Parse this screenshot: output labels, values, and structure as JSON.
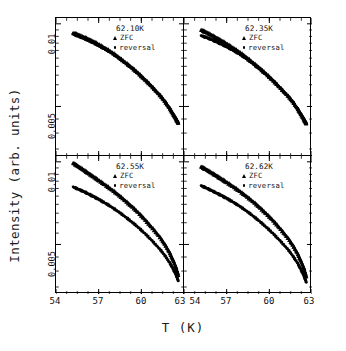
{
  "figure": {
    "xlabel": "T (K)",
    "ylabel": "Intensity (arb. units)"
  },
  "chart_data": {
    "type": "line",
    "title": "",
    "xlabel": "T (K)",
    "ylabel": "Intensity (arb. units)",
    "xlim": [
      54,
      63
    ],
    "ylim": [
      0.0033,
      0.0105
    ],
    "yscale": "log",
    "grid": false,
    "legend_position": "inside-top-right",
    "xticks": [
      54,
      57,
      60,
      63
    ],
    "xtick_labels": [
      "54",
      "57",
      "60",
      "63"
    ],
    "yticks": [
      0.005,
      0.01
    ],
    "ytick_labels": [
      "0.005",
      "0.01"
    ],
    "panels": [
      {
        "id": "panel-62-10",
        "annotation": "62.10K",
        "row": 0,
        "col": 0,
        "series": [
          {
            "name": "ZFC",
            "marker": "triangle",
            "x": [
              55.2,
              55.5,
              55.8,
              56.1,
              56.4,
              56.7,
              57.0,
              57.4,
              57.8,
              58.2,
              58.6,
              59.0,
              59.4,
              59.8,
              60.2,
              60.6,
              61.0,
              61.4,
              61.7,
              62.0,
              62.2,
              62.4,
              62.5,
              62.6
            ],
            "y": [
              0.00925,
              0.00915,
              0.009,
              0.00888,
              0.00872,
              0.00858,
              0.0084,
              0.00818,
              0.00795,
              0.0077,
              0.00742,
              0.00715,
              0.00688,
              0.0066,
              0.0063,
              0.00602,
              0.00572,
              0.00543,
              0.00518,
              0.00492,
              0.00472,
              0.00455,
              0.00444,
              0.00436
            ]
          },
          {
            "name": "reversal",
            "marker": "dot",
            "x": [
              55.2,
              55.5,
              55.8,
              56.1,
              56.4,
              56.7,
              57.0,
              57.4,
              57.8,
              58.2,
              58.6,
              59.0,
              59.4,
              59.8,
              60.2,
              60.6,
              61.0,
              61.4,
              61.7,
              62.0,
              62.2,
              62.4,
              62.5,
              62.6
            ],
            "y": [
              0.00918,
              0.00905,
              0.00892,
              0.00878,
              0.00864,
              0.0085,
              0.00834,
              0.00812,
              0.0079,
              0.00765,
              0.00738,
              0.00712,
              0.00685,
              0.00657,
              0.00628,
              0.006,
              0.0057,
              0.00542,
              0.00517,
              0.00491,
              0.00471,
              0.00454,
              0.00443,
              0.00435
            ]
          }
        ]
      },
      {
        "id": "panel-62-35",
        "annotation": "62.35K",
        "row": 0,
        "col": 1,
        "series": [
          {
            "name": "ZFC",
            "marker": "triangle",
            "x": [
              55.2,
              55.5,
              55.8,
              56.1,
              56.4,
              56.7,
              57.0,
              57.4,
              57.8,
              58.2,
              58.6,
              59.0,
              59.4,
              59.8,
              60.2,
              60.6,
              61.0,
              61.4,
              61.7,
              62.0,
              62.2,
              62.4,
              62.5,
              62.6
            ],
            "y": [
              0.0095,
              0.00935,
              0.00918,
              0.009,
              0.00882,
              0.00864,
              0.00845,
              0.0082,
              0.00795,
              0.00768,
              0.0074,
              0.00712,
              0.00684,
              0.00655,
              0.00626,
              0.00597,
              0.00568,
              0.0054,
              0.00516,
              0.0049,
              0.0047,
              0.00453,
              0.00442,
              0.00434
            ]
          },
          {
            "name": "reversal",
            "marker": "dot",
            "x": [
              55.2,
              55.5,
              55.8,
              56.1,
              56.4,
              56.7,
              57.0,
              57.4,
              57.8,
              58.2,
              58.6,
              59.0,
              59.4,
              59.8,
              60.2,
              60.6,
              61.0,
              61.4,
              61.7,
              62.0,
              62.2,
              62.4,
              62.5,
              62.6
            ],
            "y": [
              0.00905,
              0.00895,
              0.00882,
              0.00868,
              0.00854,
              0.0084,
              0.00825,
              0.00803,
              0.00781,
              0.00757,
              0.00732,
              0.00706,
              0.0068,
              0.00653,
              0.00625,
              0.00596,
              0.00567,
              0.00539,
              0.00515,
              0.00489,
              0.00469,
              0.00452,
              0.00441,
              0.00433
            ]
          }
        ]
      },
      {
        "id": "panel-62-55",
        "annotation": "62.55K",
        "row": 1,
        "col": 0,
        "series": [
          {
            "name": "ZFC",
            "marker": "triangle",
            "x": [
              55.2,
              55.5,
              55.8,
              56.1,
              56.4,
              56.7,
              57.0,
              57.4,
              57.8,
              58.2,
              58.6,
              59.0,
              59.4,
              59.8,
              60.2,
              60.6,
              61.0,
              61.4,
              61.7,
              62.0,
              62.2,
              62.4,
              62.5,
              62.6
            ],
            "y": [
              0.0099,
              0.00968,
              0.00945,
              0.00922,
              0.009,
              0.00878,
              0.00856,
              0.00828,
              0.008,
              0.00772,
              0.00742,
              0.00712,
              0.00682,
              0.00652,
              0.0062,
              0.00588,
              0.00556,
              0.00524,
              0.00496,
              0.00466,
              0.00442,
              0.00418,
              0.00402,
              0.00386
            ]
          },
          {
            "name": "reversal",
            "marker": "dot",
            "x": [
              55.2,
              55.5,
              55.8,
              56.1,
              56.4,
              56.7,
              57.0,
              57.4,
              57.8,
              58.2,
              58.6,
              59.0,
              59.4,
              59.8,
              60.2,
              60.6,
              61.0,
              61.4,
              61.7,
              62.0,
              62.2,
              62.4,
              62.5,
              62.6
            ],
            "y": [
              0.0081,
              0.00798,
              0.00785,
              0.00772,
              0.00758,
              0.00744,
              0.0073,
              0.0071,
              0.0069,
              0.00668,
              0.00646,
              0.00623,
              0.006,
              0.00576,
              0.00551,
              0.00526,
              0.005,
              0.00474,
              0.00452,
              0.00428,
              0.0041,
              0.00392,
              0.0038,
              0.00368
            ]
          }
        ]
      },
      {
        "id": "panel-62-62",
        "annotation": "62.62K",
        "row": 1,
        "col": 1,
        "series": [
          {
            "name": "ZFC",
            "marker": "triangle",
            "x": [
              55.2,
              55.5,
              55.8,
              56.1,
              56.4,
              56.7,
              57.0,
              57.4,
              57.8,
              58.2,
              58.6,
              59.0,
              59.4,
              59.8,
              60.2,
              60.6,
              61.0,
              61.4,
              61.7,
              62.0,
              62.2,
              62.4,
              62.5,
              62.6
            ],
            "y": [
              0.0096,
              0.00942,
              0.00922,
              0.00902,
              0.00882,
              0.00862,
              0.00842,
              0.00816,
              0.0079,
              0.00762,
              0.00734,
              0.00706,
              0.00676,
              0.00646,
              0.00616,
              0.00584,
              0.00552,
              0.0052,
              0.00492,
              0.00462,
              0.00438,
              0.00414,
              0.00398,
              0.00382
            ]
          },
          {
            "name": "reversal",
            "marker": "dot",
            "x": [
              55.2,
              55.5,
              55.8,
              56.1,
              56.4,
              56.7,
              57.0,
              57.4,
              57.8,
              58.2,
              58.6,
              59.0,
              59.4,
              59.8,
              60.2,
              60.6,
              61.0,
              61.4,
              61.7,
              62.0,
              62.2,
              62.4,
              62.5,
              62.6
            ],
            "y": [
              0.00818,
              0.00806,
              0.00792,
              0.00778,
              0.00764,
              0.0075,
              0.00736,
              0.00716,
              0.00695,
              0.00673,
              0.0065,
              0.00626,
              0.00602,
              0.00577,
              0.00552,
              0.00526,
              0.005,
              0.00473,
              0.0045,
              0.00426,
              0.00406,
              0.00388,
              0.00376,
              0.00364
            ]
          }
        ]
      }
    ]
  },
  "legend": {
    "zfc_label": "ZFC",
    "reversal_label": "reversal"
  },
  "ticks": {
    "y": [
      {
        "value": "0.01"
      },
      {
        "value": "0.005"
      }
    ],
    "x": [
      "54",
      "57",
      "60",
      "63",
      "54",
      "57",
      "60",
      "63"
    ]
  }
}
